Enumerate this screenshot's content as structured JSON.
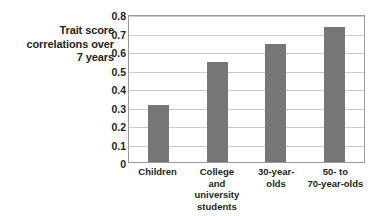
{
  "chart_data": {
    "type": "bar",
    "title": "",
    "xlabel": "",
    "ylabel": "Trait score correlations over 7 years",
    "ylim": [
      0,
      0.8
    ],
    "grid": true,
    "legend": "none",
    "categories": [
      "Children",
      "College and university students",
      "30-year-olds",
      "50- to 70-year-olds"
    ],
    "category_lines": [
      [
        "Children"
      ],
      [
        "College",
        "and",
        "university",
        "students"
      ],
      [
        "30-year-",
        "olds"
      ],
      [
        "50- to",
        "70-year-olds"
      ]
    ],
    "values": [
      0.31,
      0.54,
      0.64,
      0.73
    ],
    "yticks": [
      "0.8",
      "0.7",
      "0.6",
      "0.5",
      "0.4",
      "0.3",
      "0.2",
      "0.1",
      "0"
    ],
    "ytick_values": [
      0.8,
      0.7,
      0.6,
      0.5,
      0.4,
      0.3,
      0.2,
      0.1,
      0
    ],
    "bar_color": "#767676",
    "grid_color": "#c9c9c9",
    "frame_color": "#9a9a9a",
    "plot_background": "#ffffff"
  },
  "axis_title": {
    "line1": "Trait score",
    "line2": "correlations over",
    "line3": "7 years"
  }
}
